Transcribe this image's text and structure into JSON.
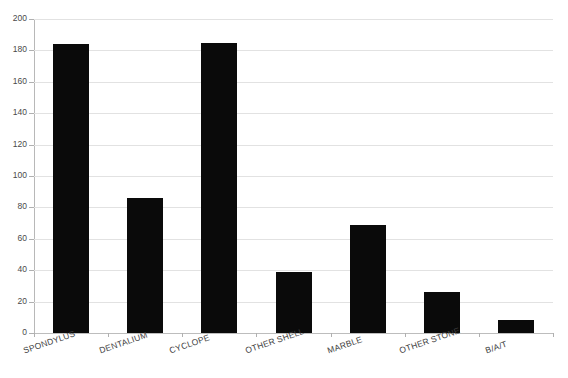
{
  "chart_data": {
    "type": "bar",
    "title": "",
    "subtitle": "",
    "xlabel": "",
    "ylabel": "",
    "ylim": [
      0,
      200
    ],
    "ytick_step": 20,
    "yticks": [
      0,
      20,
      40,
      60,
      80,
      100,
      120,
      140,
      160,
      180,
      200
    ],
    "ytick_labels": [
      "0",
      "20",
      "40",
      "60",
      "80",
      "100",
      "120",
      "140",
      "160",
      "180",
      "200"
    ],
    "grid": true,
    "grid_axis": "y",
    "legend": false,
    "legend_position": "none",
    "bar_color": "#0a0a0a",
    "grid_color": "#e2e2e2",
    "axis_color": "#b8b8b8",
    "categories": [
      "SPONDYLUS",
      "DENTALIUM",
      "CYCLOPE",
      "OTHER SHELL",
      "MARBLE",
      "OTHER STONE",
      "B/A/T"
    ],
    "values": [
      184,
      86,
      185,
      39,
      69,
      26,
      8
    ],
    "series": [
      {
        "name": "count",
        "values": [
          184,
          86,
          185,
          39,
          69,
          26,
          8
        ]
      }
    ]
  },
  "axes": {
    "y_tick_count": 11,
    "x_tick_count": 8
  }
}
